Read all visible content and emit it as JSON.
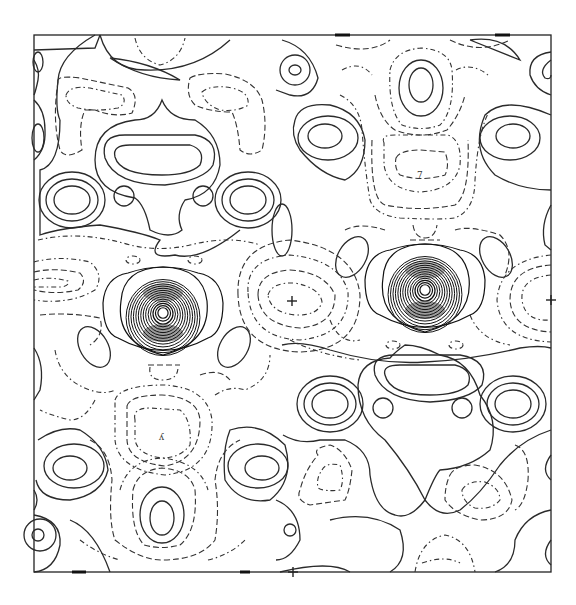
{
  "figure": {
    "type": "contour-map",
    "frame": {
      "x0": 34,
      "y0": 35,
      "x1": 551,
      "y1": 572
    },
    "line_color": "#2a2a2a",
    "background": "#ffffff"
  },
  "peaks": [
    {
      "name": "atom-peak-left",
      "cx": 163,
      "cy": 313,
      "rings": 14
    },
    {
      "name": "atom-peak-right",
      "cx": 425,
      "cy": 290,
      "rings": 14
    }
  ],
  "labels": [
    {
      "name": "label-upper-right",
      "text": "7",
      "x": 421,
      "y": 175
    },
    {
      "name": "label-lower-left",
      "text": "ʎ",
      "x": 162,
      "y": 437
    }
  ],
  "markers": [
    {
      "name": "cross-center-left",
      "x": 292,
      "y": 301
    },
    {
      "name": "cross-right-edge",
      "x": 551,
      "y": 300
    },
    {
      "name": "cross-bottom",
      "x": 293,
      "y": 572
    }
  ]
}
